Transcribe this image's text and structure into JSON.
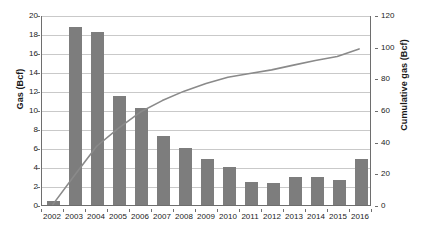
{
  "chart_data": {
    "type": "bar",
    "title": "",
    "xlabel": "",
    "ylabel": "Gas (Bcf)",
    "y2label": "Cumulative gas (Bcf)",
    "categories": [
      "2002",
      "2003",
      "2004",
      "2005",
      "2006",
      "2007",
      "2008",
      "2009",
      "2010",
      "2011",
      "2012",
      "2013",
      "2014",
      "2015",
      "2016"
    ],
    "ylim": [
      0,
      20
    ],
    "y2lim": [
      0,
      120
    ],
    "yticks": [
      0,
      2,
      4,
      6,
      8,
      10,
      12,
      14,
      16,
      18,
      20
    ],
    "y2ticks": [
      0,
      20,
      40,
      60,
      80,
      100,
      120
    ],
    "grid": true,
    "legend": "none",
    "series": [
      {
        "name": "Gas (Bcf)",
        "kind": "bar",
        "axis": "left",
        "color": "#7d7d7d",
        "values": [
          0.4,
          18.7,
          18.2,
          11.5,
          10.2,
          7.3,
          6.0,
          4.8,
          4.0,
          2.4,
          2.3,
          3.0,
          2.9,
          2.6,
          4.8
        ]
      },
      {
        "name": "Cumulative gas (Bcf)",
        "kind": "line",
        "axis": "right",
        "color": "#8a8a8a",
        "values": [
          0.4,
          19.1,
          37.3,
          48.8,
          59.0,
          66.3,
          72.3,
          77.1,
          81.1,
          83.5,
          85.8,
          88.8,
          91.7,
          94.3,
          99.1
        ]
      }
    ]
  },
  "axes": {
    "left_title": "Gas (Bcf)",
    "right_title": "Cumulative gas (Bcf)",
    "left_ticks": [
      "0",
      "2",
      "4",
      "6",
      "8",
      "10",
      "12",
      "14",
      "16",
      "18",
      "20"
    ],
    "right_ticks": [
      "0",
      "20",
      "40",
      "60",
      "80",
      "100",
      "120"
    ],
    "x_ticks": [
      "2002",
      "2003",
      "2004",
      "2005",
      "2006",
      "2007",
      "2008",
      "2009",
      "2010",
      "2011",
      "2012",
      "2013",
      "2014",
      "2015",
      "2016"
    ]
  },
  "style": {
    "bar_color": "#7d7d7d",
    "line_color": "#8a8a8a",
    "grid_color": "#c9c9c9",
    "axis_color": "#6e6e6e",
    "text_color": "#1a1a1a",
    "background": "#ffffff"
  }
}
